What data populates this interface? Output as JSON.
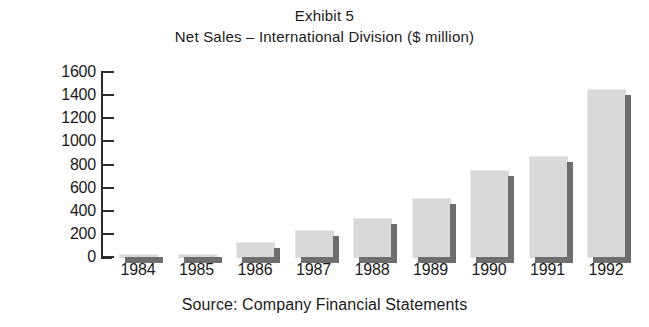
{
  "header": {
    "exhibit_label": "Exhibit 5",
    "subtitle": "Net Sales – International Division ($ million)"
  },
  "footer": {
    "source_note": "Source: Company Financial Statements"
  },
  "style": {
    "bar_face_color": "#d9d9d9",
    "bar_shadow_color": "#6e6e6e",
    "axis_color": "#2b2b2b",
    "text_color": "#1a1a1a",
    "background_color": "#ffffff"
  },
  "chart_data": {
    "type": "bar",
    "title": "Exhibit 5",
    "subtitle": "Net Sales – International Division ($ million)",
    "xlabel": "",
    "ylabel": "",
    "categories": [
      "1984",
      "1985",
      "1986",
      "1987",
      "1988",
      "1989",
      "1990",
      "1991",
      "1992"
    ],
    "values": [
      20,
      25,
      130,
      235,
      340,
      510,
      750,
      875,
      1450
    ],
    "ylim": [
      0,
      1600
    ],
    "ytick_labels": [
      "1600",
      "1400",
      "1200",
      "1000",
      "800",
      "600",
      "400",
      "200",
      "0"
    ],
    "ytick_values": [
      1600,
      1400,
      1200,
      1000,
      800,
      600,
      400,
      200,
      0
    ],
    "grid": false,
    "legend": false,
    "annotations": [
      "Source: Company Financial Statements"
    ]
  }
}
